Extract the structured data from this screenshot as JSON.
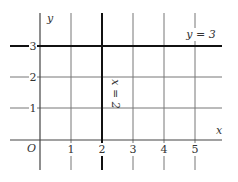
{
  "diagram": {
    "axes": {
      "x_label": "x",
      "y_label": "y",
      "origin_label": "O",
      "x_ticks": [
        "1",
        "2",
        "3",
        "4",
        "5"
      ],
      "y_ticks": [
        "1",
        "2",
        "3"
      ]
    },
    "lines": [
      {
        "equation": "x = 2",
        "orientation": "vertical",
        "value": 2
      },
      {
        "equation": "y = 3",
        "orientation": "horizontal",
        "value": 3
      }
    ],
    "colors": {
      "grid": "#666666",
      "highlight": "#111111",
      "background": "#ffffff"
    }
  }
}
